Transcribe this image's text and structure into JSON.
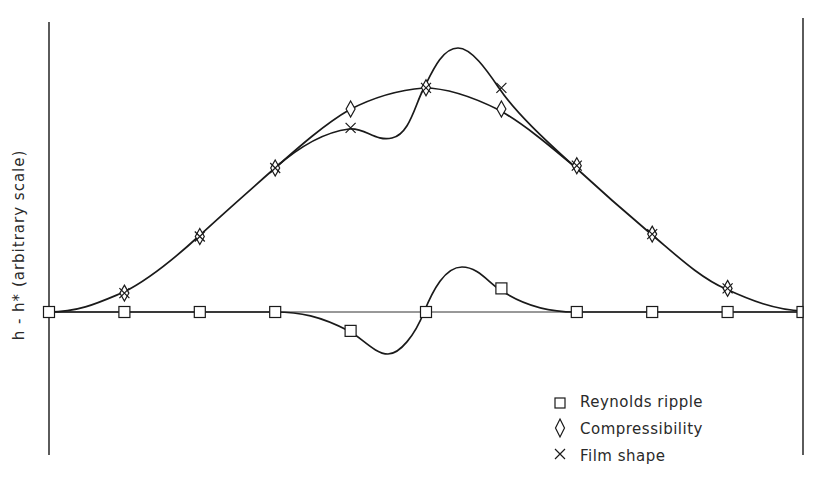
{
  "chart_data": {
    "type": "line",
    "title": "",
    "xlabel": "",
    "ylabel": "h - h* (arbitrary scale)",
    "ylabel_parts": {
      "main": "h - h",
      "sup": "*",
      "rest": "(arbitrary scale)"
    },
    "grid": false,
    "legend_position": "lower right",
    "x": [
      0,
      1,
      2,
      3,
      4,
      5,
      6,
      7,
      8,
      9,
      10
    ],
    "axis_pixels": {
      "left_x": 49,
      "right_x": 803,
      "baseline_y": 312,
      "top_y": 22,
      "bottom_y": 455
    },
    "series": [
      {
        "name": "Reynolds ripple",
        "marker": "square",
        "values": [
          0,
          0,
          0,
          0,
          -0.08,
          0,
          0.1,
          0,
          0,
          0,
          0
        ],
        "extrema": [
          {
            "x": 4.45,
            "y": -0.18
          },
          {
            "x": 5.5,
            "y": 0.19
          }
        ]
      },
      {
        "name": "Compressibility",
        "marker": "diamond",
        "values": [
          0,
          0.08,
          0.32,
          0.61,
          0.86,
          0.95,
          0.86,
          0.62,
          0.33,
          0.1,
          0
        ]
      },
      {
        "name": "Film shape",
        "marker": "cross",
        "values": [
          0,
          0.08,
          0.32,
          0.61,
          0.78,
          0.95,
          0.95,
          0.62,
          0.33,
          0.1,
          0
        ],
        "extrema": [
          {
            "x": 4.45,
            "y": 0.74
          },
          {
            "x": 5.45,
            "y": 1.13
          }
        ]
      }
    ]
  },
  "legend": {
    "items": [
      {
        "label": "Reynolds ripple",
        "marker": "square-icon"
      },
      {
        "label": "Compressibility",
        "marker": "diamond-icon"
      },
      {
        "label": "Film shape",
        "marker": "cross-icon"
      }
    ]
  },
  "colors": {
    "line": "#1a1a1a",
    "axis": "#333333",
    "background": "#ffffff"
  }
}
